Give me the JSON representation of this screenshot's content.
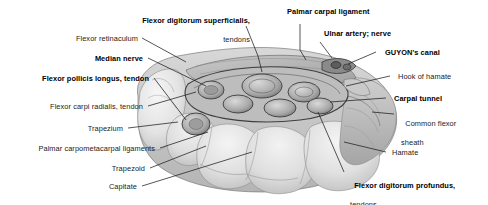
{
  "figure": {
    "style": "grayscale anatomical illustration",
    "background_color": "#ffffff",
    "bone_fill": "#e6e6e6",
    "bone_shadow": "#c2c2c2",
    "soft_tissue": "#d2d2d2",
    "tunnel_fill": "#b9b9b9",
    "outline_color": "#4a4a4a",
    "leader_color": "#1d1d1d"
  },
  "labels": {
    "flexor_digitorum_superficialis": {
      "main": "Flexor digitorum superficialis,",
      "sub": "tendons",
      "weight": "bold"
    },
    "palmar_carpal_ligament": {
      "main": "Palmar carpal ligament",
      "weight": "bold"
    },
    "ulnar_artery_nerve": {
      "main": "Ulnar artery; nerve",
      "weight": "bold"
    },
    "guyons_canal": {
      "main": "GUYON's canal",
      "weight": "bold"
    },
    "hook_of_hamate": {
      "main": "Hook of hamate",
      "weight": "regular"
    },
    "carpal_tunnel": {
      "main": "Carpal tunnel",
      "weight": "bold"
    },
    "common_flexor_sheath": {
      "main": "Common flexor",
      "sub": "sheath",
      "weight": "regular"
    },
    "hamate": {
      "main": "Hamate",
      "weight": "regular"
    },
    "flexor_digitorum_profundus": {
      "main": "Flexor digitorum profundus,",
      "sub": "tendons",
      "weight": "bold"
    },
    "flexor_retinaculum": {
      "main": "Flexor retinaculum",
      "weight": "regular"
    },
    "median_nerve": {
      "main": "Median nerve",
      "weight": "bold"
    },
    "flexor_pollicis_longus": {
      "main": "Flexor pollicis longus, tendon",
      "weight": "bold"
    },
    "flexor_carpi_radialis": {
      "main": "Flexor carpi radialis, tendon",
      "weight": "regular"
    },
    "trapezium": {
      "main": "Trapezium",
      "weight": "regular"
    },
    "palmar_carpometacarpal_ligaments": {
      "main": "Palmar carpometacarpal ligaments",
      "weight": "regular"
    },
    "trapezoid": {
      "main": "Trapezoid",
      "weight": "regular"
    },
    "capitate": {
      "main": "Capitate",
      "weight": "regular"
    }
  }
}
